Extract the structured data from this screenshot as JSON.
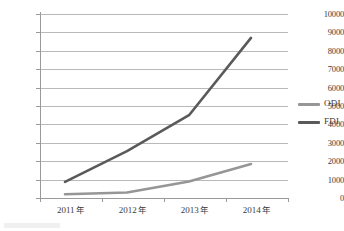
{
  "chart_data": {
    "type": "line",
    "title": "",
    "xlabel": "",
    "ylabel": "",
    "categories": [
      "2011 年",
      "2012 年",
      "2013 年",
      "2014 年"
    ],
    "x_tick_labels": [
      "2011 年",
      "2012 年",
      "2013 年",
      "2014 年"
    ],
    "y_tick_labels": [
      "10000",
      "9000",
      "8000",
      "7000",
      "6000",
      "5000",
      "4000",
      "3000",
      "2000",
      "1000",
      "0"
    ],
    "y_ticks": [
      10000,
      9000,
      8000,
      7000,
      6000,
      5000,
      4000,
      3000,
      2000,
      1000,
      0
    ],
    "ylim": [
      0,
      10000
    ],
    "grid": true,
    "legend_position": "right",
    "series": [
      {
        "name": "ODI",
        "color": "#969696",
        "values": [
          200,
          300,
          900,
          1850
        ]
      },
      {
        "name": "FDI",
        "color": "#5a5a5a",
        "values": [
          880,
          2550,
          4500,
          8700
        ]
      }
    ]
  },
  "legend": {
    "items": [
      {
        "label": "ODI",
        "color": "#969696"
      },
      {
        "label": "FDI",
        "color": "#5a5a5a"
      }
    ]
  },
  "axes": {
    "y_labels": [
      "10000",
      "9000",
      "8000",
      "7000",
      "6000",
      "5000",
      "4000",
      "3000",
      "2000",
      "1000",
      "0"
    ],
    "x_labels": [
      "2011 年",
      "2012 年",
      "2013 年",
      "2014 年"
    ]
  },
  "style": {
    "gridline_color": "#b9b9b9",
    "axis_color": "#9a9a9a",
    "background": "#ffffff",
    "text_color": "#3c3c3c"
  }
}
